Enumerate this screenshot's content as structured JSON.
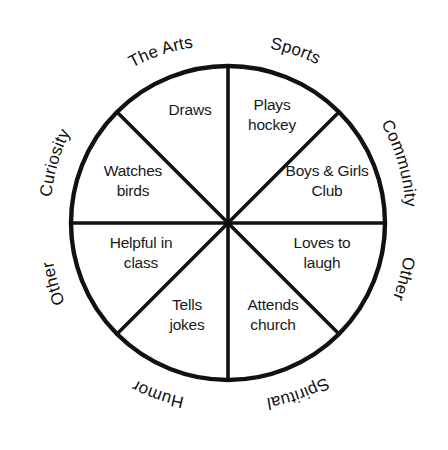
{
  "diagram": {
    "shape": "circle",
    "segment_count": 8,
    "line_color": "#111111",
    "background_color": "#ffffff",
    "text_color": "#1a1a1a",
    "geometry": {
      "center_x": 228,
      "center_y": 223,
      "radius": 157
    }
  },
  "segments": [
    {
      "id": "sports",
      "category": "Sports",
      "entry_line1": "Plays",
      "entry_line2": "hockey",
      "angle_start_deg": 270,
      "angle_end_deg": 315
    },
    {
      "id": "community",
      "category": "Community",
      "entry_line1": "Boys & Girls",
      "entry_line2": "Club",
      "angle_start_deg": 315,
      "angle_end_deg": 360
    },
    {
      "id": "other-right",
      "category": "Other",
      "entry_line1": "Loves to",
      "entry_line2": "laugh",
      "angle_start_deg": 0,
      "angle_end_deg": 45
    },
    {
      "id": "spiritual",
      "category": "Spiritual",
      "entry_line1": "Attends",
      "entry_line2": "church",
      "angle_start_deg": 45,
      "angle_end_deg": 90
    },
    {
      "id": "humor",
      "category": "Humor",
      "entry_line1": "Tells",
      "entry_line2": "jokes",
      "angle_start_deg": 90,
      "angle_end_deg": 135
    },
    {
      "id": "other-left",
      "category": "Other",
      "entry_line1": "Helpful in",
      "entry_line2": "class",
      "angle_start_deg": 135,
      "angle_end_deg": 180
    },
    {
      "id": "curiosity",
      "category": "Curiosity",
      "entry_line1": "Watches",
      "entry_line2": "birds",
      "angle_start_deg": 180,
      "angle_end_deg": 225
    },
    {
      "id": "the-arts",
      "category": "The Arts",
      "entry_line1": "Draws",
      "entry_line2": "",
      "angle_start_deg": 225,
      "angle_end_deg": 270
    }
  ],
  "outer_labels": [
    {
      "id": "the-arts",
      "text": "The Arts"
    },
    {
      "id": "sports",
      "text": "Sports"
    },
    {
      "id": "community",
      "text": "Community"
    },
    {
      "id": "other-right",
      "text": "Other"
    },
    {
      "id": "spiritual",
      "text": "Spiritual"
    },
    {
      "id": "humor",
      "text": "Humor"
    },
    {
      "id": "other-left",
      "text": "Other"
    },
    {
      "id": "curiosity",
      "text": "Curiosity"
    }
  ]
}
